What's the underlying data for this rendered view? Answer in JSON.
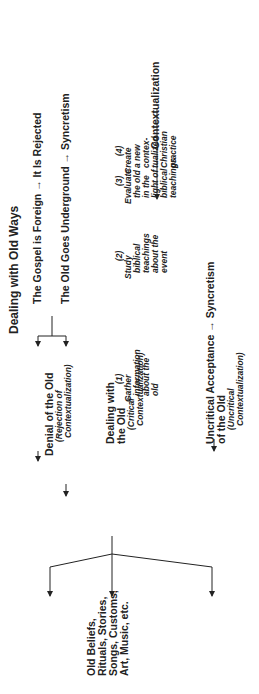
{
  "title": "Dealing with Old Ways",
  "source": {
    "lines": [
      "Old Beliefs,",
      "Rituals, Stories,",
      "Songs, Customs,",
      "Art, Music, etc."
    ]
  },
  "branches": {
    "denial": {
      "label": "Denial of the Old",
      "sub": [
        "(Rejection of",
        "Contextualization)"
      ],
      "outcomes": [
        {
          "label": "The Gospel is Foreign",
          "result": "It Is Rejected"
        },
        {
          "label": "The Old Goes Underground",
          "result": "Syncretism"
        }
      ]
    },
    "critical": {
      "label": [
        "Dealing with",
        "the Old"
      ],
      "sub": [
        "(Critical",
        "Contextualization)"
      ],
      "steps": [
        {
          "num": "(1)",
          "lines": [
            "Gather",
            "information",
            "about the",
            "old"
          ]
        },
        {
          "num": "(2)",
          "lines": [
            "Study",
            "biblical",
            "teachings",
            "about the",
            "event"
          ]
        },
        {
          "num": "(3)",
          "lines": [
            "Evaluate",
            "the old",
            "in the",
            "light of",
            "biblical",
            "teachings"
          ]
        },
        {
          "num": "(4)",
          "lines": [
            "Create",
            "a new",
            "contex-",
            "tualized",
            "Christian",
            "practice"
          ]
        }
      ],
      "result": "Contextualization"
    },
    "uncritical": {
      "label": [
        "Uncritical Acceptance",
        "of the Old"
      ],
      "result": "Syncretism",
      "sub": [
        "(Uncritical",
        "Contextualization)"
      ]
    }
  }
}
